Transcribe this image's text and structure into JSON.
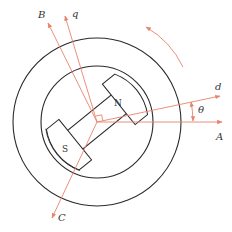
{
  "diagram": {
    "colors": {
      "stroke": "#2a2a2a",
      "axis": "#e8836b",
      "background": "#ffffff"
    },
    "center": [
      97,
      122
    ],
    "stator": {
      "outer_radius": 84,
      "inner_radius": 56
    },
    "rotor": {
      "angle_deg": -39,
      "north_label": "N",
      "south_label": "S"
    },
    "axes": [
      {
        "id": "A",
        "label": "A",
        "angle_deg": 0
      },
      {
        "id": "d",
        "label": "d",
        "angle_deg": 15
      },
      {
        "id": "q",
        "label": "q",
        "angle_deg": 105
      },
      {
        "id": "B",
        "label": "B",
        "angle_deg": 120
      },
      {
        "id": "C",
        "label": "C",
        "angle_deg": 240
      }
    ],
    "angle_label": "θ",
    "rotation_direction": "counter-clockwise"
  }
}
